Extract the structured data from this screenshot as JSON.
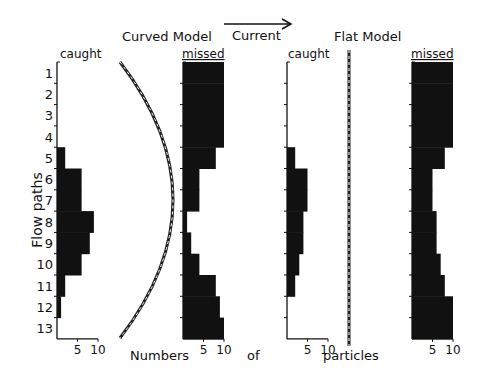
{
  "titles": {
    "curved": "Curved Model",
    "flat": "Flat Model",
    "current": "Current"
  },
  "axis": {
    "ylabel": "Flow paths",
    "xlabel_parts": [
      "Numbers",
      "of",
      "particles"
    ],
    "row_labels": [
      "1",
      "2",
      "3",
      "4",
      "5",
      "6",
      "7",
      "8",
      "9",
      "10",
      "11",
      "12",
      "13"
    ],
    "tick_labels": [
      "5",
      "10"
    ]
  },
  "panels": {
    "curved_caught": "caught",
    "curved_missed": "missed",
    "flat_caught": "caught",
    "flat_missed": "missed"
  },
  "colors": {
    "bar": "#111111",
    "line": "#222222",
    "background": "#ffffff"
  },
  "chart_data": {
    "type": "bar",
    "orientation": "horizontal",
    "categories": [
      "1",
      "2",
      "3",
      "4",
      "5",
      "6",
      "7",
      "8",
      "9",
      "10",
      "11",
      "12",
      "13"
    ],
    "ylabel": "Flow paths",
    "xlabel": "Numbers of particles",
    "xlim": [
      0,
      10
    ],
    "xticks": [
      5,
      10
    ],
    "series": [
      {
        "name": "Curved Model - caught",
        "values": [
          0,
          0,
          0,
          0,
          2,
          6,
          6,
          9,
          8,
          6,
          2,
          1,
          0
        ]
      },
      {
        "name": "Curved Model - missed",
        "values": [
          10,
          10,
          10,
          10,
          8,
          4,
          4,
          1,
          2,
          4,
          8,
          9,
          10
        ]
      },
      {
        "name": "Flat Model - caught",
        "values": [
          0,
          0,
          0,
          0,
          2,
          5,
          5,
          4,
          4,
          3,
          2,
          0,
          0
        ]
      },
      {
        "name": "Flat Model - missed",
        "values": [
          10,
          10,
          10,
          10,
          8,
          5,
          5,
          6,
          6,
          7,
          8,
          10,
          10
        ]
      }
    ],
    "annotations": [
      "Curved Model",
      "Flat Model",
      "Current (arrow pointing right)"
    ]
  }
}
